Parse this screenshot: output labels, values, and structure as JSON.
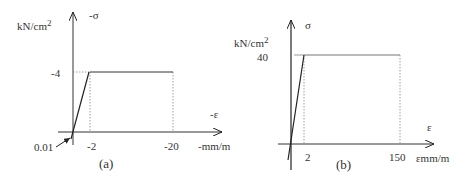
{
  "diagrams": [
    {
      "id": "a",
      "caption": "(a)",
      "y_unit": "kN/cm",
      "y_unit_exp": "2",
      "y_axis_label": "-σ",
      "x_axis_label": "-ε",
      "x_unit": "-mm/m",
      "y_tick": "-4",
      "x_ticks": [
        "-2",
        "-20"
      ],
      "origin_annotation": "0.01"
    },
    {
      "id": "b",
      "caption": "(b)",
      "y_unit": "kN/cm",
      "y_unit_exp": "2",
      "y_axis_label": "σ",
      "x_axis_label": "ε",
      "x_unit": "εmm/m",
      "y_tick": "40",
      "x_ticks": [
        "2",
        "150"
      ]
    }
  ],
  "colors": {
    "line": "#222222",
    "dotted": "#888888",
    "plateau_b": "#777777"
  }
}
